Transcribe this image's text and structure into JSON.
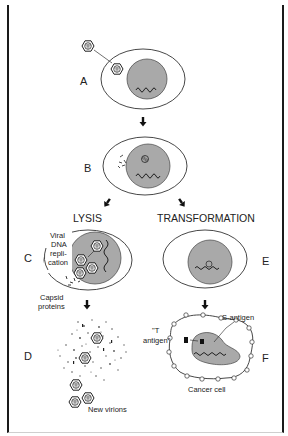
{
  "figure": {
    "panels": {
      "A": {
        "label": "A"
      },
      "B": {
        "label": "B"
      },
      "C": {
        "label": "C"
      },
      "D": {
        "label": "D"
      },
      "E": {
        "label": "E"
      },
      "F": {
        "label": "F"
      }
    },
    "pathways": {
      "lysis": "LYSIS",
      "transformation": "TRANSFORMATION"
    },
    "annotations": {
      "viral_dna_line1": "Viral",
      "viral_dna_line2": "DNA",
      "viral_dna_line3": "repli-",
      "viral_dna_line4": "cation",
      "capsid_line1": "Capsid",
      "capsid_line2": "proteins",
      "new_virions": "New virions",
      "t_antigen_line1": "\"T",
      "t_antigen_line2": "antigen\"",
      "s_antigen": "S-antigen",
      "cancer_cell": "Cancer cell"
    },
    "colors": {
      "nucleus": "#a9a9a9",
      "outline": "#333333",
      "frame_bar": "#262626"
    }
  }
}
